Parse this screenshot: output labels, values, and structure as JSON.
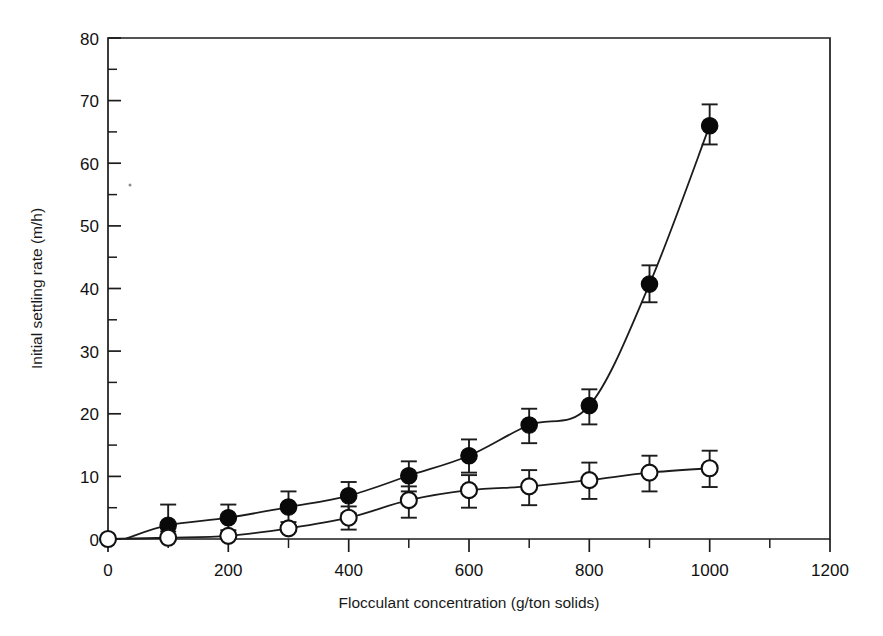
{
  "chart_data": {
    "type": "scatter",
    "title": "",
    "subtitle": "",
    "xlabel": "Flocculant concentration (g/ton solids)",
    "ylabel": "Initial settling rate (m/h)",
    "xlim": [
      0,
      1200
    ],
    "ylim": [
      0,
      80
    ],
    "x_ticks": [
      0,
      200,
      400,
      600,
      800,
      1000,
      1200
    ],
    "x_tick_labels": [
      "0",
      "200",
      "400",
      "600",
      "800",
      "1000",
      "1200"
    ],
    "x_minor_tick_interval": 100,
    "y_ticks": [
      0,
      10,
      20,
      30,
      40,
      50,
      60,
      70,
      80
    ],
    "y_tick_labels": [
      "0",
      "10",
      "20",
      "30",
      "40",
      "50",
      "60",
      "70",
      "80"
    ],
    "y_minor_tick_interval": 5,
    "grid": false,
    "legend": "none",
    "frame": "box",
    "series": [
      {
        "name": "filled-circles",
        "marker": "filled circle",
        "marker_color": "#090909",
        "fit_line": true,
        "x": [
          100,
          200,
          300,
          400,
          500,
          600,
          700,
          800,
          900,
          1000
        ],
        "values": [
          2.2,
          3.4,
          5.1,
          6.9,
          10.1,
          13.3,
          18.2,
          21.3,
          40.7,
          66.0
        ],
        "err_low": [
          1.0,
          2.0,
          2.4,
          2.8,
          2.5,
          2.7,
          2.9,
          3.0,
          2.9,
          3.0
        ],
        "err_high": [
          3.3,
          2.1,
          2.5,
          2.2,
          2.3,
          2.6,
          2.6,
          2.6,
          3.0,
          3.4
        ]
      },
      {
        "name": "open-circles",
        "marker": "open circle",
        "marker_color": "#ffffff",
        "fit_line": true,
        "x": [
          0,
          100,
          200,
          300,
          400,
          500,
          600,
          700,
          800,
          900,
          1000
        ],
        "values": [
          0.0,
          0.2,
          0.5,
          1.7,
          3.4,
          6.2,
          7.8,
          8.4,
          9.4,
          10.6,
          11.3
        ],
        "err_low": [
          0.0,
          0.0,
          0.0,
          0.0,
          1.9,
          2.8,
          2.8,
          3.0,
          3.0,
          3.0,
          3.0
        ],
        "err_high": [
          0.0,
          0.0,
          0.0,
          0.0,
          1.8,
          2.2,
          2.4,
          2.6,
          2.8,
          2.7,
          2.8
        ]
      }
    ],
    "annotations": []
  },
  "axes": {
    "x_title": "Flocculant concentration (g/ton solids)",
    "y_title": "Initial settling rate (m/h)",
    "x_tick_labels": [
      "0",
      "200",
      "400",
      "600",
      "800",
      "1000",
      "1200"
    ],
    "y_tick_labels": [
      "0",
      "10",
      "20",
      "30",
      "40",
      "50",
      "60",
      "70",
      "80"
    ]
  },
  "style": {
    "ink": "#1c1c1c",
    "background": "#ffffff",
    "filled_marker": "#090909",
    "open_marker_fill": "#ffffff"
  }
}
